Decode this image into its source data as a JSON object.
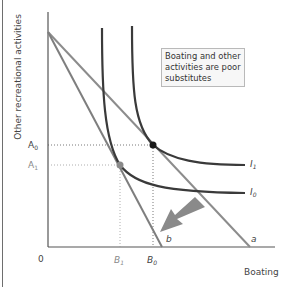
{
  "diagram": {
    "type": "indifference-curve-budget-line",
    "y_axis_title": "Other recreational activities",
    "x_axis_title": "Boating",
    "origin_label": "0",
    "y_ticks": [
      {
        "name": "A",
        "sub": "0",
        "tone": "dark"
      },
      {
        "name": "A",
        "sub": "1",
        "tone": "gray"
      }
    ],
    "x_ticks": [
      {
        "name": "B",
        "sub": "1",
        "tone": "gray"
      },
      {
        "name": "B",
        "sub": "0",
        "tone": "dark"
      }
    ],
    "budget_lines": [
      {
        "label": "a",
        "description": "original budget line"
      },
      {
        "label": "b",
        "description": "new budget line after boating price rise"
      }
    ],
    "indifference_curves": [
      {
        "name": "I",
        "sub": "1"
      },
      {
        "name": "I",
        "sub": "0"
      }
    ],
    "note": "Boating and other activities are poor substitutes",
    "colors": {
      "curve": "#3a3a3a",
      "budget_line": "#8c8c8c",
      "arrow": "#8a8a8a",
      "point_original": "#1a1a1a",
      "point_new": "#8a8a8a",
      "note_border": "#b9b9b9",
      "note_bg": "#f7f7f7"
    }
  }
}
